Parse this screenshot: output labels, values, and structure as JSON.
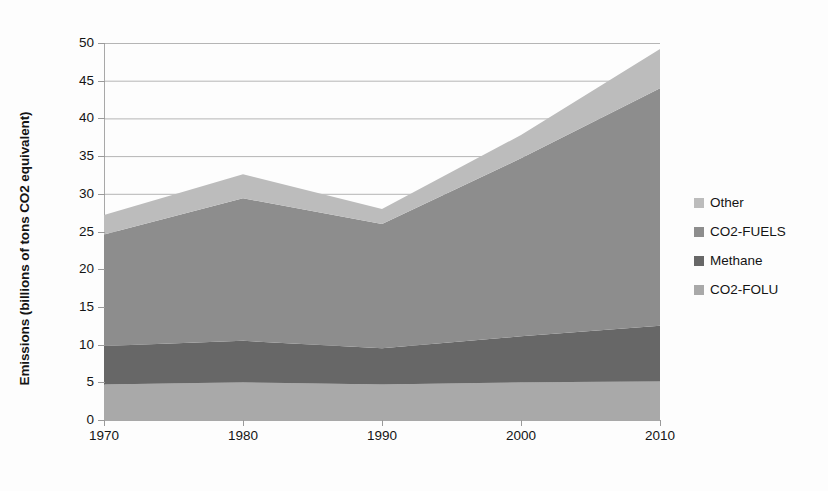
{
  "chart_data": {
    "type": "area",
    "stacked": true,
    "title": "",
    "subtitle": "",
    "xlabel": "",
    "ylabel": "Emissions (billions of tons CO2 equivalent)",
    "x": [
      1970,
      1980,
      1990,
      2000,
      2010
    ],
    "xtick_labels": [
      "1970",
      "1980",
      "1990",
      "2000",
      "2010"
    ],
    "xlim": [
      1970,
      2010
    ],
    "ylim": [
      0,
      50
    ],
    "ytick_labels": [
      "0",
      "5",
      "10",
      "15",
      "20",
      "25",
      "30",
      "35",
      "40",
      "45",
      "50"
    ],
    "yticks": [
      0,
      5,
      10,
      15,
      20,
      25,
      30,
      35,
      40,
      45,
      50
    ],
    "grid": "horizontal",
    "legend_position": "right",
    "stack_order_bottom_to_top": [
      "CO2-FOLU",
      "Methane",
      "CO2-FUELS",
      "Other"
    ],
    "series": [
      {
        "name": "CO2-FOLU",
        "color": "#a9a9a9",
        "values": [
          4.7,
          5.0,
          4.7,
          5.0,
          5.1
        ]
      },
      {
        "name": "Methane",
        "color": "#676767",
        "values": [
          5.1,
          5.5,
          4.8,
          6.1,
          7.4
        ]
      },
      {
        "name": "CO2-FUELS",
        "color": "#8d8d8d",
        "values": [
          14.8,
          18.9,
          16.5,
          23.6,
          31.5
        ]
      },
      {
        "name": "Other",
        "color": "#bcbcbc",
        "values": [
          2.6,
          3.2,
          2.0,
          3.1,
          5.2
        ]
      }
    ],
    "stack_totals": [
      27.2,
      32.6,
      28.0,
      37.8,
      49.2
    ],
    "annotations": []
  },
  "legend": {
    "items": [
      {
        "label": "Other",
        "color": "#bcbcbc"
      },
      {
        "label": "CO2-FUELS",
        "color": "#8d8d8d"
      },
      {
        "label": "Methane",
        "color": "#676767"
      },
      {
        "label": "CO2-FOLU",
        "color": "#a9a9a9"
      }
    ]
  },
  "axes": {
    "y_title": "Emissions (billions of tons CO2 equivalent)",
    "grid_color": "#b5b5b5",
    "axis_color": "#a8a8a8"
  }
}
